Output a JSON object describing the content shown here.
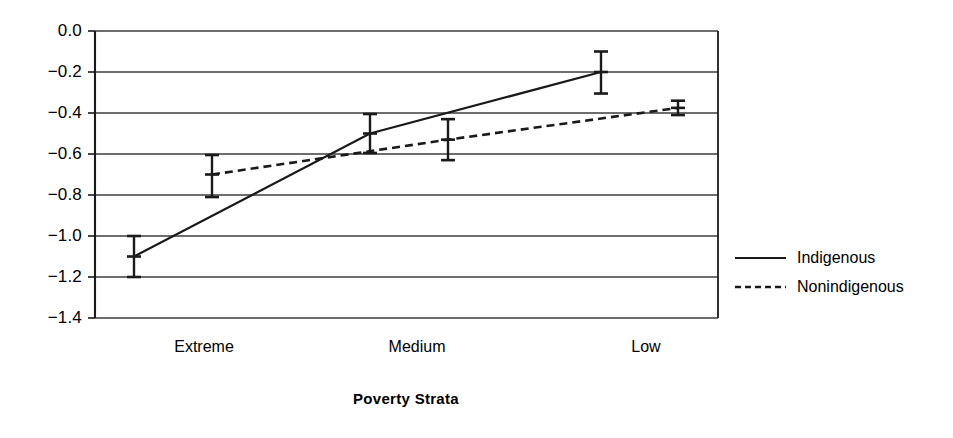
{
  "chart_data": {
    "type": "line",
    "title": "",
    "subtitle": "",
    "xlabel": "Poverty Strata",
    "ylabel": "",
    "categories": [
      "Extreme",
      "Medium",
      "Low"
    ],
    "ylim": [
      -1.4,
      0.0
    ],
    "ytick_labels": [
      "0.0",
      "−0.2",
      "−0.4",
      "−0.6",
      "−0.8",
      "−1.0",
      "−1.2",
      "−1.4"
    ],
    "ytick_values": [
      0.0,
      -0.2,
      -0.4,
      -0.6,
      -0.8,
      -1.0,
      -1.2,
      -1.4
    ],
    "grid": "horizontal",
    "legend_position": "right",
    "error_bars": true,
    "series": [
      {
        "name": "Indigenous",
        "style": "solid",
        "color": "#000000",
        "values": [
          -1.1,
          -0.5,
          -0.2
        ],
        "err_upper": [
          -1.0,
          -0.405,
          -0.1
        ],
        "err_lower": [
          -1.2,
          -0.595,
          -0.305
        ],
        "x_px": [
          134,
          370,
          601
        ]
      },
      {
        "name": "Nonindigenous",
        "style": "dashed",
        "color": "#000000",
        "values": [
          -0.7,
          -0.53,
          -0.375
        ],
        "err_upper": [
          -0.605,
          -0.43,
          -0.34
        ],
        "err_lower": [
          -0.81,
          -0.63,
          -0.41
        ],
        "x_px": [
          212,
          448,
          678
        ]
      }
    ],
    "annotations": []
  },
  "axes": {
    "y_axis_name": "value-axis",
    "x_axis_name": "poverty-strata-axis"
  },
  "legend": {
    "items": [
      {
        "label": "Indigenous",
        "swatch": "solid-line-swatch"
      },
      {
        "label": "Nonindigenous",
        "swatch": "dashed-line-swatch"
      }
    ]
  },
  "xtick_px": [
    204,
    417,
    646
  ],
  "style": {
    "line_color": "#1a1a1a",
    "grid_color": "#3d3d3d",
    "axis_color": "#1a1a1a",
    "background": "#ffffff"
  }
}
